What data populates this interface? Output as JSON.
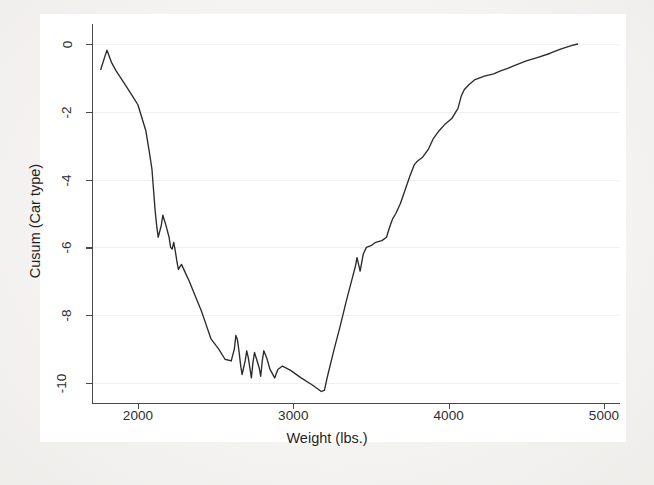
{
  "figure": {
    "background_color": "#f4f3f1",
    "plot_background_color": "#ffffff",
    "line_color": "#2b2b2b",
    "grid_color": "#eef0f3",
    "axis_color": "#4a4a4a"
  },
  "chart_data": {
    "type": "line",
    "title": "",
    "subtitle": "",
    "xlabel": "Weight (lbs.)",
    "ylabel": "Cusum (Car type)",
    "xlim": [
      1700,
      4900
    ],
    "ylim": [
      -10.6,
      0.4
    ],
    "xticks": [
      2000,
      3000,
      4000,
      5000
    ],
    "xtick_labels": [
      "2000",
      "3000",
      "4000",
      "5000"
    ],
    "yticks": [
      0,
      -2,
      -4,
      -6,
      -8,
      -10
    ],
    "ytick_labels": [
      "0",
      "-2",
      "-4",
      "-6",
      "-8",
      "-10"
    ],
    "grid": "horizontal",
    "legend": "none",
    "series": [
      {
        "name": "Cusum (Car type)",
        "x": [
          1760,
          1800,
          1830,
          1860,
          1910,
          1980,
          2000,
          2020,
          2050,
          2070,
          2090,
          2100,
          2110,
          2120,
          2130,
          2150,
          2160,
          2180,
          2200,
          2210,
          2220,
          2230,
          2240,
          2250,
          2260,
          2280,
          2300,
          2330,
          2370,
          2410,
          2440,
          2470,
          2520,
          2560,
          2600,
          2620,
          2630,
          2640,
          2650,
          2660,
          2670,
          2690,
          2700,
          2710,
          2720,
          2730,
          2740,
          2750,
          2760,
          2780,
          2790,
          2800,
          2810,
          2830,
          2850,
          2880,
          2900,
          2930,
          2980,
          3050,
          3120,
          3180,
          3200,
          3220,
          3260,
          3300,
          3340,
          3380,
          3400,
          3410,
          3420,
          3430,
          3440,
          3450,
          3470,
          3500,
          3530,
          3570,
          3600,
          3620,
          3640,
          3660,
          3690,
          3720,
          3750,
          3780,
          3800,
          3830,
          3870,
          3900,
          3940,
          3980,
          4020,
          4060,
          4080,
          4100,
          4130,
          4170,
          4230,
          4290,
          4330,
          4380,
          4430,
          4500,
          4570,
          4650,
          4720,
          4790,
          4830
        ],
        "y": [
          -0.75,
          -0.18,
          -0.55,
          -0.8,
          -1.15,
          -1.65,
          -1.8,
          -2.1,
          -2.55,
          -3.1,
          -3.7,
          -4.3,
          -4.9,
          -5.35,
          -5.7,
          -5.35,
          -5.05,
          -5.35,
          -5.7,
          -6.0,
          -6.05,
          -5.85,
          -6.1,
          -6.4,
          -6.65,
          -6.5,
          -6.7,
          -7.0,
          -7.45,
          -7.9,
          -8.3,
          -8.7,
          -9.0,
          -9.3,
          -9.35,
          -9.0,
          -8.6,
          -8.72,
          -9.05,
          -9.45,
          -9.75,
          -9.35,
          -9.05,
          -9.25,
          -9.55,
          -9.85,
          -9.4,
          -9.1,
          -9.25,
          -9.55,
          -9.8,
          -9.35,
          -9.05,
          -9.28,
          -9.6,
          -9.85,
          -9.6,
          -9.5,
          -9.62,
          -9.85,
          -10.05,
          -10.25,
          -10.22,
          -9.8,
          -9.05,
          -8.35,
          -7.6,
          -6.9,
          -6.55,
          -6.3,
          -6.5,
          -6.7,
          -6.45,
          -6.2,
          -6.0,
          -5.95,
          -5.85,
          -5.8,
          -5.7,
          -5.4,
          -5.15,
          -5.0,
          -4.7,
          -4.3,
          -3.9,
          -3.55,
          -3.45,
          -3.35,
          -3.1,
          -2.8,
          -2.55,
          -2.35,
          -2.2,
          -1.9,
          -1.55,
          -1.35,
          -1.2,
          -1.05,
          -0.95,
          -0.88,
          -0.8,
          -0.72,
          -0.62,
          -0.5,
          -0.4,
          -0.28,
          -0.15,
          -0.05,
          0.0
        ]
      }
    ]
  }
}
